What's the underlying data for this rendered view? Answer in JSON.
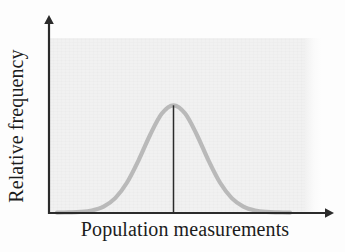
{
  "figure": {
    "kind": "normal-distribution-sketch",
    "background_color": "#fdfdfd",
    "panel_color": "#f1f1f1",
    "axis_color": "#2b2b2b",
    "curve_color": "#b9b9b9",
    "mean_line_color": "#2b2b2b"
  },
  "axes": {
    "x_label": "Population measurements",
    "y_label": "Relative frequency",
    "x_tick_labels": [],
    "y_tick_labels": [],
    "grid": false
  },
  "chart_data": {
    "type": "line",
    "title": "",
    "subtitle": "",
    "xlabel": "Population measurements",
    "ylabel": "Relative frequency",
    "xlim": [
      -4,
      4
    ],
    "ylim": [
      0,
      1.08
    ],
    "grid": false,
    "legend": [],
    "legend_position": "none",
    "annotations": [
      {
        "name": "mean-line",
        "kind": "vertical-line",
        "x": 0,
        "y_from": 0,
        "y_to": 1,
        "label": ""
      }
    ],
    "series": [
      {
        "name": "Relative frequency",
        "curve": "normal",
        "mean": 0,
        "stdev": 1,
        "x": [
          -4.0,
          -3.6,
          -3.2,
          -2.8,
          -2.4,
          -2.0,
          -1.6,
          -1.2,
          -0.8,
          -0.4,
          0.0,
          0.4,
          0.8,
          1.2,
          1.6,
          2.0,
          2.4,
          2.8,
          3.2,
          3.6,
          4.0
        ],
        "values": [
          0.0,
          0.002,
          0.006,
          0.02,
          0.056,
          0.135,
          0.278,
          0.487,
          0.726,
          0.923,
          1.0,
          0.923,
          0.726,
          0.487,
          0.278,
          0.135,
          0.056,
          0.02,
          0.006,
          0.002,
          0.0
        ]
      }
    ]
  }
}
